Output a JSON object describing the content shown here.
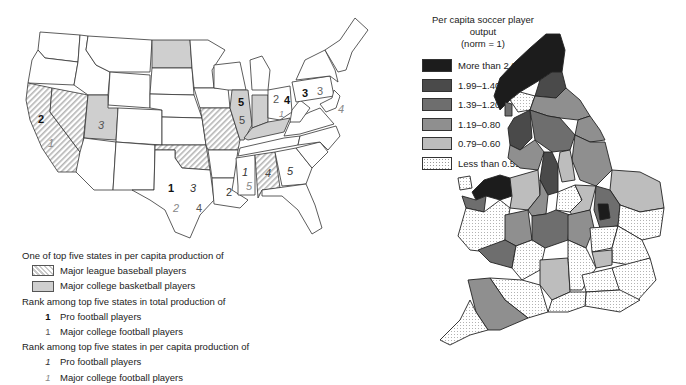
{
  "us_map": {
    "legend": {
      "per_capita_heading": "One of top five states in per capita production of",
      "baseball_label": "Major league baseball players",
      "basketball_label": "Major college basketball players",
      "total_heading": "Rank among top five states in total production of",
      "total_pro_glyph": "1",
      "total_pro_label": "Pro football players",
      "total_college_glyph": "1",
      "total_college_label": "Major college football players",
      "percap_heading": "Rank among top five states in per capita production of",
      "percap_pro_glyph": "1",
      "percap_pro_label": "Pro football players",
      "percap_college_glyph": "1",
      "percap_college_label": "Major college football players"
    },
    "labels": {
      "ca_total_pro": "2",
      "ca_percap_college": "1",
      "ut_percap_pro": "3",
      "tx_total_pro": "1",
      "tx_percap_pro": "3",
      "tx_percap_college": "2",
      "tx_total_college": "4",
      "il_total_pro": "5",
      "il_total_college": "5",
      "la_total_college": "2",
      "ms_percap_pro": "1",
      "ms_percap_college": "5",
      "al_percap_pro": "4",
      "ga_percap_pro": "5",
      "oh_total_college": "2",
      "oh_total_pro": "4",
      "oh_percap_college": "1",
      "pa_total_pro": "3",
      "pa_total_college": "3",
      "md_percap_college": "4"
    },
    "colors": {
      "hatch": "#c9c9c9",
      "gray_fill": "#cfcfcf",
      "outline": "#333333"
    }
  },
  "uk_map": {
    "legend": {
      "title_line1": "Per capita soccer player output",
      "title_line2": "(norm = 1)",
      "items": [
        {
          "label": "More than 2.00",
          "color": "#1c1c1c"
        },
        {
          "label": "1.99–1.40",
          "color": "#4a4a4a"
        },
        {
          "label": "1.39–1.20",
          "color": "#6e6e6e"
        },
        {
          "label": "1.19–0.80",
          "color": "#8f8f8f"
        },
        {
          "label": "0.79–0.60",
          "color": "#bdbdbd"
        },
        {
          "label": "Less than 0.59",
          "color": "dotted"
        }
      ]
    }
  }
}
